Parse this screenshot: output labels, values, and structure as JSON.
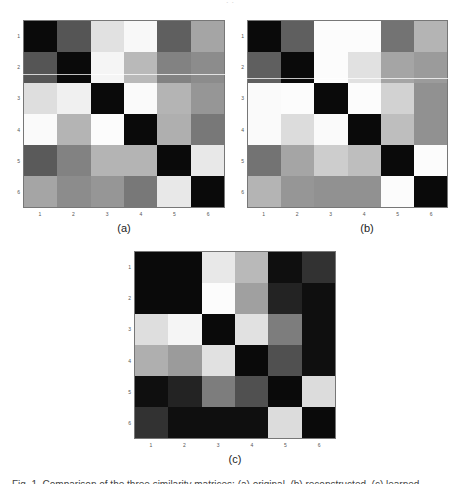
{
  "header": {
    "cut_text": "· ·"
  },
  "chart_data": [
    {
      "type": "heatmap",
      "label": "(a)",
      "colormap": "grayscale (0=black, 255=white)",
      "x_ticks": [
        "1",
        "2",
        "3",
        "4",
        "5",
        "6"
      ],
      "y_ticks": [
        "1",
        "2",
        "3",
        "4",
        "5",
        "6"
      ],
      "values": [
        [
          10,
          85,
          225,
          248,
          95,
          165
        ],
        [
          85,
          10,
          245,
          185,
          130,
          140
        ],
        [
          222,
          240,
          10,
          250,
          180,
          150
        ],
        [
          250,
          180,
          252,
          10,
          175,
          120
        ],
        [
          90,
          130,
          180,
          180,
          10,
          232
        ],
        [
          165,
          140,
          150,
          120,
          232,
          10
        ]
      ]
    },
    {
      "type": "heatmap",
      "label": "(b)",
      "colormap": "grayscale (0=black, 255=white)",
      "x_ticks": [
        "1",
        "2",
        "3",
        "4",
        "5",
        "6"
      ],
      "y_ticks": [
        "1",
        "2",
        "3",
        "4",
        "5",
        "6"
      ],
      "values": [
        [
          10,
          95,
          252,
          252,
          115,
          180
        ],
        [
          95,
          10,
          252,
          225,
          165,
          155
        ],
        [
          250,
          252,
          10,
          252,
          210,
          145
        ],
        [
          250,
          220,
          250,
          10,
          190,
          145
        ],
        [
          115,
          165,
          205,
          190,
          10,
          252
        ],
        [
          180,
          150,
          145,
          145,
          252,
          10
        ]
      ]
    },
    {
      "type": "heatmap",
      "label": "(c)",
      "colormap": "grayscale (0=black, 255=white)",
      "x_ticks": [
        "1",
        "2",
        "3",
        "4",
        "5",
        "6"
      ],
      "y_ticks": [
        "1",
        "2",
        "3",
        "4",
        "5",
        "6"
      ],
      "values": [
        [
          10,
          10,
          232,
          185,
          15,
          50
        ],
        [
          10,
          10,
          252,
          160,
          35,
          15
        ],
        [
          222,
          245,
          10,
          225,
          125,
          15
        ],
        [
          175,
          155,
          225,
          10,
          80,
          15
        ],
        [
          15,
          35,
          125,
          80,
          10,
          220
        ],
        [
          50,
          15,
          15,
          15,
          220,
          10
        ]
      ]
    }
  ],
  "panels": [
    {
      "label": "(a)",
      "x": 23,
      "y": 20,
      "w": 202,
      "h": 188,
      "label_x": 109,
      "label_y": 222,
      "artifact_y": 54
    },
    {
      "label": "(b)",
      "x": 247,
      "y": 20,
      "w": 201,
      "h": 188,
      "label_x": 352,
      "label_y": 222,
      "artifact_y": 58
    },
    {
      "label": "(c)",
      "x": 134,
      "y": 251,
      "w": 202,
      "h": 188,
      "label_x": 220,
      "label_y": 453,
      "artifact_y": -1
    }
  ],
  "caption": {
    "cut_text": "Fig. 1. Comparison of the three similarity matrices: (a) original, (b) reconstructed, (c) learned."
  }
}
